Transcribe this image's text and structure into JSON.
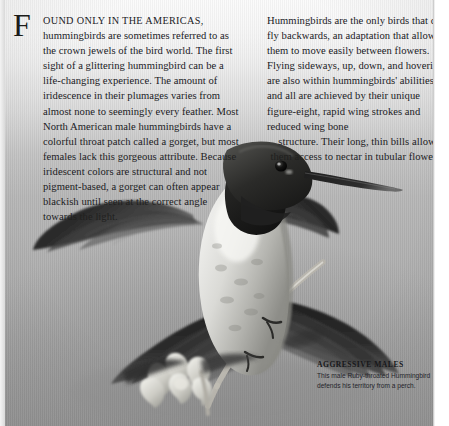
{
  "page": {
    "background_top_color": "#fbfbfb",
    "background_mid_color": "#b6b6b6",
    "background_bottom_color": "#a3a3a3",
    "text_color": "#20201e"
  },
  "article": {
    "dropcap": "F",
    "left_column": {
      "lead_smallcaps": "OUND ONLY IN THE AMERICAS,",
      "body": " hummingbirds are sometimes referred to as the crown jewels of the bird world. The first sight of a glittering hummingbird can be a life-changing experience. The amount of iridescence in their plumages varies from almost none to seemingly every feather. Most North American male hummingbirds have a colorful throat patch called a gorget, but most females lack this gorgeous attribute. Because iridescent colors are structural and not pigment-based, a gorget can often appear blackish until seen at the correct angle towards the light."
    },
    "right_column": {
      "body": "Hummingbirds are the only birds that can fly backwards, an adaptation that allows them to move easily between flowers. Flying sideways, up, down, and hovering are also within hummingbirds' abilities, and all are achieved by their unique figure-eight, rapid wing strokes and reduced wing bone",
      "tail": "structure. Their long, thin bills allow them access to nectar in tubular flowers."
    }
  },
  "caption": {
    "title": "AGGRESSIVE MALES",
    "body": "This male Ruby-throated Hummingbird defends his territory from a perch."
  },
  "photo": {
    "subject": "perched-ruby-throated-hummingbird",
    "treatment": "grayscale",
    "elements": [
      "hummingbird",
      "perch-twig",
      "flower-leaves"
    ]
  }
}
